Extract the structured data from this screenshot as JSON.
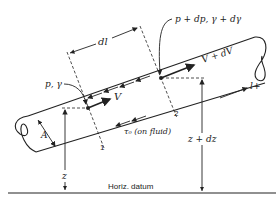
{
  "figure": {
    "labels": {
      "section1_props": "p, γ",
      "section2_props": "p + dp, γ + dγ",
      "velocity1": "V",
      "velocity2": "V + dV",
      "length_element": "dl",
      "area": "A",
      "shear_stress": "τ₀ (on fluid)",
      "elevation1": "z",
      "elevation2": "z + dz",
      "section1_number": "1",
      "section2_number": "2",
      "flow_direction": "l+",
      "datum": "Horiz. datum"
    },
    "colors": {
      "line": "#222222",
      "background": "#ffffff"
    }
  }
}
